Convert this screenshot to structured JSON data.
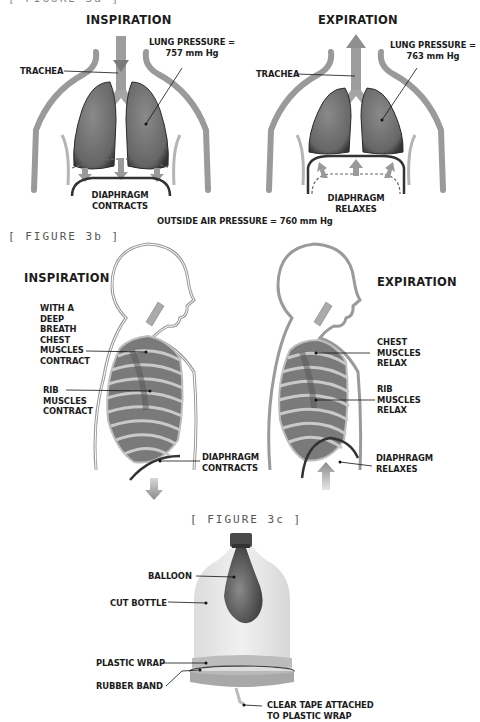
{
  "figure_3a": {
    "partial_caption": "[ FIGURE 3a ]",
    "inspiration": {
      "title": "INSPIRATION",
      "trachea_label": "TRACHEA",
      "lung_pressure_label": "LUNG PRESSURE =\n757 mm Hg",
      "diaphragm_label": "DIAPHRAGM\nCONTRACTS"
    },
    "expiration": {
      "title": "EXPIRATION",
      "trachea_label": "TRACHEA",
      "lung_pressure_label": "LUNG PRESSURE =\n763 mm Hg",
      "diaphragm_label": "DIAPHRAGM\nRELAXES"
    },
    "outside_air_pressure": "OUTSIDE AIR PRESSURE = 760 mm Hg"
  },
  "figure_3b": {
    "caption": "[ FIGURE 3b ]",
    "inspiration": {
      "title": "INSPIRATION",
      "chest_label": "WITH A\nDEEP\nBREATH\nCHEST\nMUSCLES\nCONTRACT",
      "rib_label": "RIB\nMUSCLES\nCONTRACT",
      "diaphragm_label": "DIAPHRAGM\nCONTRACTS"
    },
    "expiration": {
      "title": "EXPIRATION",
      "chest_label": "CHEST\nMUSCLES\nRELAX",
      "rib_label": "RIB\nMUSCLES\nRELAX",
      "diaphragm_label": "DIAPHRAGM\nRELAXES"
    }
  },
  "figure_3c": {
    "caption": "[ FIGURE 3c ]",
    "labels": {
      "balloon": "BALLOON",
      "cut_bottle": "CUT BOTTLE",
      "plastic_wrap": "PLASTIC WRAP",
      "rubber_band": "RUBBER BAND",
      "clear_tape": "CLEAR TAPE ATTACHED\nTO PLASTIC WRAP"
    }
  },
  "colors": {
    "lung": "#6e6e6e",
    "body_outline": "#8a8a8a",
    "label_text": "#1c1c1c",
    "caption_text": "#555555",
    "bottle": "#e4e4e4",
    "balloon": "#5a5a5a"
  }
}
